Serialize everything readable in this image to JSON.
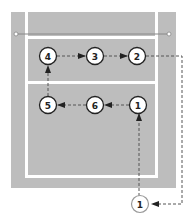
{
  "diagram": {
    "colors": {
      "court": "#bdbdbd",
      "lines": "#ffffff",
      "ink": "#222222",
      "dash": "#555555"
    },
    "front_row": [
      {
        "id": "p4",
        "label": "4"
      },
      {
        "id": "p3",
        "label": "3"
      },
      {
        "id": "p2",
        "label": "2"
      }
    ],
    "back_row": [
      {
        "id": "p5",
        "label": "5"
      },
      {
        "id": "p6",
        "label": "6"
      },
      {
        "id": "p1",
        "label": "1"
      }
    ],
    "server": {
      "id": "server",
      "label": "1"
    },
    "flow": [
      "2 → 1 (serve position)",
      "1 → 1 (court)",
      "1 → 6",
      "6 → 5",
      "5 → 4",
      "4 → 3",
      "3 → 2"
    ]
  }
}
